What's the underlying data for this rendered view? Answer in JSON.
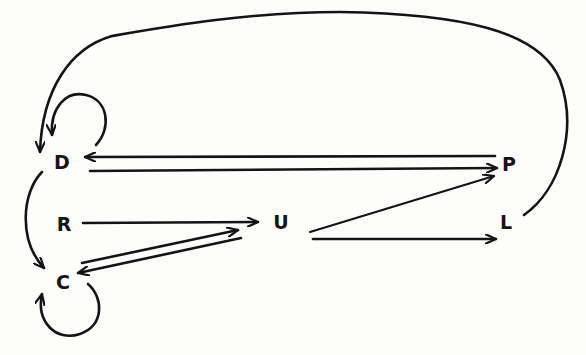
{
  "diagram": {
    "type": "directed-graph",
    "colors": {
      "background": "#fdfdfb",
      "ink": "#141414"
    },
    "nodes": [
      {
        "id": "D",
        "label": "D",
        "x": 62,
        "y": 161
      },
      {
        "id": "R",
        "label": "R",
        "x": 64,
        "y": 224
      },
      {
        "id": "C",
        "label": "C",
        "x": 63,
        "y": 282
      },
      {
        "id": "U",
        "label": "U",
        "x": 281,
        "y": 222
      },
      {
        "id": "P",
        "label": "P",
        "x": 509,
        "y": 164
      },
      {
        "id": "L",
        "label": "L",
        "x": 506,
        "y": 222
      }
    ],
    "edges": [
      {
        "from": "D",
        "to": "D",
        "kind": "self-loop"
      },
      {
        "from": "P",
        "to": "D"
      },
      {
        "from": "D",
        "to": "P"
      },
      {
        "from": "D",
        "to": "C",
        "kind": "curved"
      },
      {
        "from": "R",
        "to": "U"
      },
      {
        "from": "C",
        "to": "U"
      },
      {
        "from": "U",
        "to": "C"
      },
      {
        "from": "U",
        "to": "P"
      },
      {
        "from": "U",
        "to": "L"
      },
      {
        "from": "L",
        "to": "D",
        "kind": "large-curved-loop"
      },
      {
        "from": "C",
        "to": "C",
        "kind": "self-loop"
      }
    ]
  }
}
